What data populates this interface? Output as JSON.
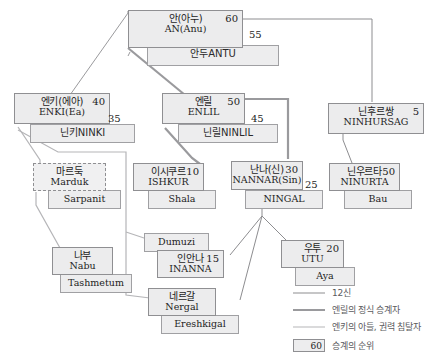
{
  "diagram": {
    "nodes": [
      {
        "id": "an",
        "kr": "안(아누)",
        "en": "AN(Anu)",
        "rank": "60",
        "spouse_kr": "안두ANTU",
        "spouse_en": "",
        "spouse_rank": "55"
      },
      {
        "id": "enki",
        "kr": "엔키(에아)",
        "en": "ENKI(Ea)",
        "rank": "40",
        "spouse_kr": "닌키NINKI",
        "spouse_en": "",
        "spouse_rank": "35"
      },
      {
        "id": "enlil",
        "kr": "엔릴",
        "en": "ENLIL",
        "rank": "50",
        "spouse_kr": "닌릴NINLIL",
        "spouse_en": "",
        "spouse_rank": "45"
      },
      {
        "id": "ninhursag",
        "kr": "닌후르쌍",
        "en": "NINHURSAG",
        "rank": "5",
        "spouse_kr": "",
        "spouse_en": "",
        "spouse_rank": ""
      },
      {
        "id": "marduk",
        "kr": "마르둑",
        "en": "Marduk",
        "rank": "",
        "spouse_kr": "",
        "spouse_en": "Sarpanit",
        "spouse_rank": ""
      },
      {
        "id": "ishkur",
        "kr": "이시쿠르",
        "en": "ISHKUR",
        "rank": "10",
        "spouse_kr": "",
        "spouse_en": "Shala",
        "spouse_rank": ""
      },
      {
        "id": "nannar",
        "kr": "난나(신)",
        "en": "NANNAR(Sin)",
        "rank": "30",
        "spouse_kr": "",
        "spouse_en": "NINGAL",
        "spouse_rank": "25"
      },
      {
        "id": "ninurta",
        "kr": "닌우르타",
        "en": "NINURTA",
        "rank": "50",
        "spouse_kr": "",
        "spouse_en": "Bau",
        "spouse_rank": ""
      },
      {
        "id": "nabu",
        "kr": "나부",
        "en": "Nabu",
        "rank": "",
        "spouse_kr": "",
        "spouse_en": "Tashmetum",
        "spouse_rank": ""
      },
      {
        "id": "inanna",
        "kr": "인안나",
        "en": "INANNA",
        "rank": "15",
        "spouse_kr": "",
        "spouse_en": "Dumuzi",
        "spouse_rank": ""
      },
      {
        "id": "utu",
        "kr": "우투",
        "en": "UTU",
        "rank": "20",
        "spouse_kr": "",
        "spouse_en": "Aya",
        "spouse_rank": ""
      },
      {
        "id": "nergal",
        "kr": "네르갈",
        "en": "Nergal",
        "rank": "",
        "spouse_kr": "",
        "spouse_en": "Ereshkigal",
        "spouse_rank": ""
      }
    ]
  },
  "legend": {
    "items": [
      {
        "style": "thin",
        "label": "12신"
      },
      {
        "style": "thick",
        "label": "엔릴의 정식 승계자"
      },
      {
        "style": "mid",
        "label": "엔키의 아들, 권력 침탈자"
      }
    ],
    "rank_box": {
      "value": "60",
      "label": "승계의 순위"
    }
  },
  "colors": {
    "box_fill": "#ececed",
    "box_border": "#8f8f92",
    "line_thin": "#8d8d90",
    "line_thick": "#9a9a9d",
    "line_mid": "#b5b5b8",
    "text": "#1d1d1d",
    "legend_text": "#5a5a5d"
  }
}
